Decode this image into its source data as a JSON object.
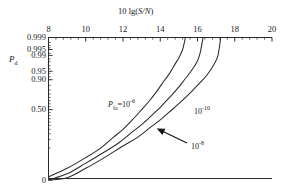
{
  "chart_data": {
    "type": "line",
    "title": "",
    "xlabel": "10 lg(S/N)",
    "ylabel": "Pd",
    "xlabel_parts": {
      "prefix": "10 lg(",
      "s": "S",
      "slash": "/",
      "n": "N",
      "suffix": ")"
    },
    "ylabel_parts": {
      "base": "P",
      "sub": "d"
    },
    "xlim": [
      8,
      20
    ],
    "ylim_prob": [
      0.0,
      0.999
    ],
    "grid": false,
    "legend_position": "inline-annotations",
    "x_ticks": [
      8,
      10,
      12,
      14,
      16,
      18,
      20
    ],
    "x_tick_labels": [
      "8",
      "10",
      "12",
      "14",
      "16",
      "18",
      "20"
    ],
    "x_minor_per_interval": 4,
    "y_ticks": [
      0,
      0.5,
      0.9,
      0.95,
      0.99,
      0.995,
      0.999
    ],
    "y_tick_labels": [
      "0",
      "0.50",
      "0.90",
      "0.95",
      "0.99",
      "0.995",
      "0.999"
    ],
    "axis_position": {
      "x_axis": "top",
      "y_axis": "left"
    },
    "series": [
      {
        "name": "Pfa = 10^-6",
        "pfa_mantissa": "10",
        "pfa_exponent": "-6",
        "label_text": "=10",
        "label_base": "P",
        "label_sub": "fa",
        "points_x": [
          8.0,
          9.0,
          10.0,
          10.8,
          11.5,
          12.0,
          12.5,
          13.0,
          13.4,
          13.8,
          14.2,
          14.5,
          14.8,
          15.0,
          15.2,
          15.35
        ],
        "points_y": [
          0.002,
          0.006,
          0.02,
          0.05,
          0.12,
          0.2,
          0.33,
          0.5,
          0.64,
          0.78,
          0.89,
          0.94,
          0.975,
          0.987,
          0.995,
          0.999
        ]
      },
      {
        "name": "Pfa = 10^-8",
        "pfa_mantissa": "10",
        "pfa_exponent": "-8",
        "label_text": "10",
        "points_x": [
          8.0,
          9.0,
          10.0,
          11.0,
          11.8,
          12.5,
          13.0,
          13.6,
          14.0,
          14.5,
          14.9,
          15.3,
          15.7,
          16.0,
          16.15,
          16.3
        ],
        "points_y": [
          0.001,
          0.003,
          0.011,
          0.035,
          0.08,
          0.17,
          0.26,
          0.42,
          0.54,
          0.7,
          0.81,
          0.9,
          0.955,
          0.982,
          0.993,
          0.999
        ]
      },
      {
        "name": "Pfa = 10^-10",
        "pfa_mantissa": "10",
        "pfa_exponent": "-10",
        "label_text": "10",
        "points_x": [
          8.0,
          9.0,
          10.0,
          11.0,
          12.0,
          12.8,
          13.5,
          14.0,
          14.6,
          15.1,
          15.6,
          16.1,
          16.5,
          16.9,
          17.1,
          17.25
        ],
        "points_y": [
          0.0006,
          0.0018,
          0.006,
          0.02,
          0.06,
          0.12,
          0.23,
          0.33,
          0.49,
          0.63,
          0.76,
          0.87,
          0.93,
          0.975,
          0.99,
          0.999
        ]
      }
    ],
    "annotations": [
      {
        "name": "pfa-1e-6-label",
        "text_base": "P",
        "text_sub": "fa",
        "text_mid": "=10",
        "text_sup": "-6",
        "x_px": 108,
        "y_px": 101
      },
      {
        "name": "pfa-1e-10-label",
        "text_mid": "10",
        "text_sup": "-10",
        "x_px": 194,
        "y_px": 108
      },
      {
        "name": "pfa-1e-8-label",
        "text_mid": "10",
        "text_sup": "-8",
        "x_px": 191,
        "y_px": 143
      },
      {
        "name": "arrow-to-middle-curve",
        "from_x_px": 187,
        "from_y_px": 143,
        "to_x_px": 158,
        "to_y_px": 129
      }
    ]
  }
}
